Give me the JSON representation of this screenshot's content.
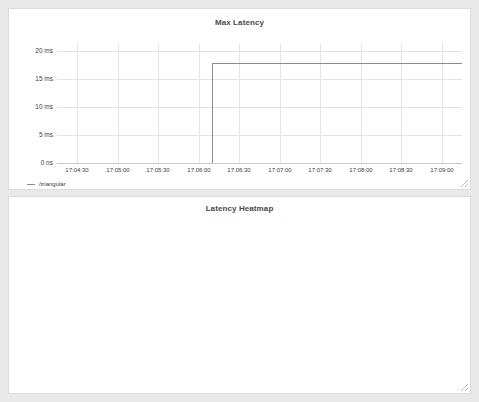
{
  "panels": {
    "max_latency": {
      "title": "Max Latency",
      "legend": {
        "label": "/triangular",
        "color": "#8b8b8b"
      },
      "y_unit_zero": "0 ns",
      "resize_handle": "resize-handle"
    },
    "heatmap": {
      "title": "Latency Heatmap",
      "resize_handle": "resize-handle"
    }
  },
  "chart_data": [
    {
      "type": "line",
      "title": "Max Latency",
      "xlabel": "",
      "ylabel": "",
      "x_tick_labels": [
        "17:04:30",
        "17:05:00",
        "17:05:30",
        "17:06:00",
        "17:06:30",
        "17:07:00",
        "17:07:30",
        "17:08:00",
        "17:08:30",
        "17:09:00"
      ],
      "y_tick_labels": [
        "0 ns",
        "5 ms",
        "10 ms",
        "15 ms",
        "20 ms"
      ],
      "y_tick_values": [
        0,
        5,
        10,
        15,
        20
      ],
      "ylim": [
        0,
        21.5
      ],
      "grid": true,
      "legend_position": "below-left",
      "series": [
        {
          "name": "/triangular",
          "color": "#8b8b8b",
          "step": true,
          "x": [
            "17:06:10",
            "17:06:10",
            "17:09:05"
          ],
          "values": [
            0,
            18.0,
            18.0
          ]
        }
      ],
      "annotations": [
        "Step rise from 0 ns to ~18 ms at approximately 17:06:10, flat thereafter"
      ]
    },
    {
      "type": "heatmap",
      "title": "Latency Heatmap",
      "xlabel": "",
      "ylabel": "",
      "x_tick_labels": [
        "17:04:30",
        "17:05:00",
        "17:05:30",
        "17:06:00",
        "17:06:30",
        "17:07:00",
        "17:07:30",
        "17:08:00",
        "17:08:30",
        "17:09:00"
      ],
      "y_tick_labels": [
        "+Inf",
        "27.96 ms",
        "22.37 ms",
        "16.78 ms",
        "15.38 ms",
        "13.98 ms",
        "12.58 ms",
        "11.18 ms",
        "9.79 ms",
        "8.39 ms",
        "6.99 ms",
        "5.59 ms",
        "4.19 ms",
        "3.84 ms",
        "3.50 ms",
        "3.15 ms",
        "2.80 ms",
        "2.45 ms",
        "2.10 ms",
        "1.75 ms",
        "1.40 ms",
        "1.05 ms",
        "1.00 ms"
      ],
      "grid": true,
      "colorscale": {
        "low": "#f2f2f2",
        "high": "#111111",
        "note": "light = low count, dark = high count"
      },
      "columns": [
        {
          "time": "17:06:20",
          "top_bucket_index": 10,
          "top_bucket_label": "6.99 ms"
        },
        {
          "time": "17:06:35",
          "top_bucket_index": 10,
          "top_bucket_label": "6.99 ms"
        },
        {
          "time": "17:06:50",
          "top_bucket_index": 10,
          "top_bucket_label": "6.99 ms"
        },
        {
          "time": "17:07:05",
          "top_bucket_index": 10,
          "top_bucket_label": "6.99 ms"
        },
        {
          "time": "17:07:20",
          "top_bucket_index": 14,
          "top_bucket_label": "3.50 ms"
        },
        {
          "time": "17:07:35",
          "top_bucket_index": 14,
          "top_bucket_label": "3.50 ms"
        },
        {
          "time": "17:07:50",
          "top_bucket_index": 13,
          "top_bucket_label": "3.84 ms"
        },
        {
          "time": "17:08:05",
          "top_bucket_index": 13,
          "top_bucket_label": "3.84 ms"
        },
        {
          "time": "17:08:20",
          "top_bucket_index": 13,
          "top_bucket_label": "3.84 ms"
        },
        {
          "time": "17:08:35",
          "top_bucket_index": 16,
          "top_bucket_label": "2.80 ms"
        },
        {
          "time": "17:08:50",
          "top_bucket_index": 16,
          "top_bucket_label": "2.80 ms"
        },
        {
          "time": "17:09:00",
          "top_bucket_index": 15,
          "top_bucket_label": "3.15 ms"
        }
      ]
    }
  ]
}
